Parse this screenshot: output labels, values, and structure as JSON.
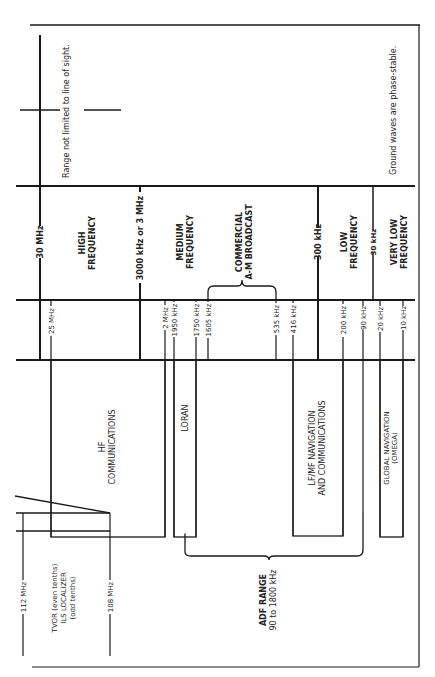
{
  "diagram": {
    "orientation": "rotated-90-ccw",
    "notes": {
      "range_note": "Range not limited to line of sight.",
      "ground_note": "Ground waves are phase-stable."
    },
    "band_boundaries": [
      {
        "label": "30 MHz"
      },
      {
        "label": "3000 kHz or 3 MHz"
      },
      {
        "label": "300 kHz"
      },
      {
        "label": "30 kHz"
      }
    ],
    "bands": [
      {
        "line1": "HIGH",
        "line2": "FREQUENCY"
      },
      {
        "line1": "MEDIUM",
        "line2": "FREQUENCY"
      },
      {
        "line1": "LOW",
        "line2": "FREQUENCY"
      },
      {
        "line1": "VERY LOW",
        "line2": "FREQUENCY"
      }
    ],
    "broadcast": {
      "line1": "COMMERCIAL",
      "line2": "A-M BROADCAST"
    },
    "ticks": [
      {
        "label": "25 MHz"
      },
      {
        "label": "2 MHz"
      },
      {
        "label": "1950 kHz"
      },
      {
        "label": "1750 kHz"
      },
      {
        "label": "1605 kHz"
      },
      {
        "label": "535 kHz"
      },
      {
        "label": "416 kHz"
      },
      {
        "label": "200 kHz"
      },
      {
        "label": "90 kHz"
      },
      {
        "label": "20 kHz"
      },
      {
        "label": "10 kHz"
      }
    ],
    "services": [
      {
        "line1": "HF",
        "line2": "COMMUNICATIONS"
      },
      {
        "line1": "LORAN"
      },
      {
        "line1": "LF/MF NAVIGATION",
        "line2": "AND COMMUNICATIONS"
      },
      {
        "line1": "GLOBAL NAVIGATION",
        "line2": "(OMEGA)"
      }
    ],
    "adf": {
      "line1": "ADF RANGE",
      "line2": "90 to 1800 kHz"
    },
    "vhf": {
      "upper": "112 MHz",
      "lower": "108 MHz",
      "line1": "TVOR (even tenths)",
      "line2": "ILS LOCALIZER",
      "line3": "(odd tenths)"
    }
  }
}
